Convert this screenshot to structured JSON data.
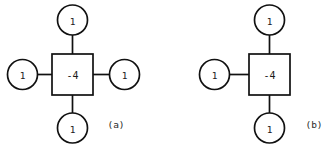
{
  "figure": {
    "background_color": "#ffffff",
    "stroke_color": "#111111",
    "text_color": "#1a1a1a",
    "width": 331,
    "height": 148
  },
  "diagrams": [
    {
      "id": "diagram-a",
      "caption": "(a)",
      "caption_x": 116,
      "caption_y": 124,
      "center": {
        "label": "-4",
        "shape": "square",
        "cx": 72.5,
        "cy": 74.5,
        "size": 41
      },
      "neighbors": [
        {
          "position": "top",
          "label": "1",
          "cx": 72.5,
          "cy": 20.0,
          "r": 15
        },
        {
          "position": "left",
          "label": "1",
          "cx": 22.5,
          "cy": 74.5,
          "r": 15
        },
        {
          "position": "right",
          "label": "1",
          "cx": 124.5,
          "cy": 74.5,
          "r": 15
        },
        {
          "position": "bottom",
          "label": "1",
          "cx": 72.5,
          "cy": 128.0,
          "r": 15
        }
      ]
    },
    {
      "id": "diagram-b",
      "caption": "(b)",
      "caption_x": 314,
      "caption_y": 124,
      "center": {
        "label": "-4",
        "shape": "square",
        "cx": 269.5,
        "cy": 74.5,
        "size": 41
      },
      "neighbors": [
        {
          "position": "top",
          "label": "1",
          "cx": 269.5,
          "cy": 20.0,
          "r": 15
        },
        {
          "position": "left",
          "label": "1",
          "cx": 214.5,
          "cy": 74.5,
          "r": 15
        },
        {
          "position": "bottom",
          "label": "1",
          "cx": 269.5,
          "cy": 128.0,
          "r": 15
        }
      ]
    }
  ]
}
